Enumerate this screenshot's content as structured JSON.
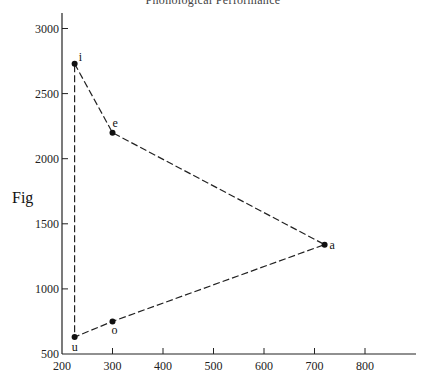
{
  "page": {
    "header_title": "Phonological Performance",
    "fig_label": "Fig"
  },
  "chart_data": {
    "type": "scatter",
    "title": "Phonological Performance",
    "xlabel": "",
    "ylabel": "",
    "xlim": [
      200,
      880
    ],
    "ylim": [
      500,
      3100
    ],
    "x_ticks": [
      200,
      300,
      400,
      500,
      600,
      700,
      800
    ],
    "y_ticks": [
      500,
      1000,
      1500,
      2000,
      2500,
      3000
    ],
    "grid": false,
    "legend": null,
    "connector": "dashed polygon i-e-a-o-u-i",
    "points": [
      {
        "label": "i",
        "x": 225,
        "y": 2730
      },
      {
        "label": "e",
        "x": 300,
        "y": 2200
      },
      {
        "label": "a",
        "x": 720,
        "y": 1340
      },
      {
        "label": "o",
        "x": 300,
        "y": 750
      },
      {
        "label": "u",
        "x": 225,
        "y": 630
      }
    ],
    "series": [
      {
        "name": "vowel triangle",
        "x": [
          225,
          300,
          720,
          300,
          225,
          225
        ],
        "y": [
          2730,
          2200,
          1340,
          750,
          630,
          2730
        ]
      }
    ]
  }
}
